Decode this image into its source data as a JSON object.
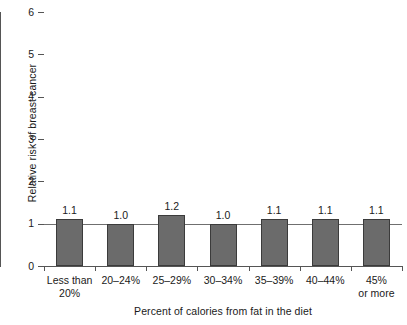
{
  "chart_data": {
    "type": "bar",
    "title": "",
    "xlabel": "Percent of calories from fat in the diet",
    "ylabel": "Relative risk of breast cancer",
    "categories": [
      "Less than\n20%",
      "20–24%",
      "25–29%",
      "30–34%",
      "35–39%",
      "40–44%",
      "45%\nor more"
    ],
    "values": [
      1.1,
      1.0,
      1.2,
      1.0,
      1.1,
      1.1,
      1.1
    ],
    "value_labels": [
      "1.1",
      "1.0",
      "1.2",
      "1.0",
      "1.1",
      "1.1",
      "1.1"
    ],
    "ylim": [
      0,
      6
    ],
    "ytick_labels": [
      "0",
      "1",
      "2",
      "3",
      "4",
      "5",
      "6"
    ],
    "ytick_values": [
      0,
      1,
      2,
      3,
      4,
      5,
      6
    ],
    "grid": false,
    "legend": "none",
    "reference_line": 1,
    "bar_color": "#6b6b6b",
    "bar_border_color": "#3b3b3b",
    "axis_color": "#555555",
    "background_color": "#ffffff"
  }
}
